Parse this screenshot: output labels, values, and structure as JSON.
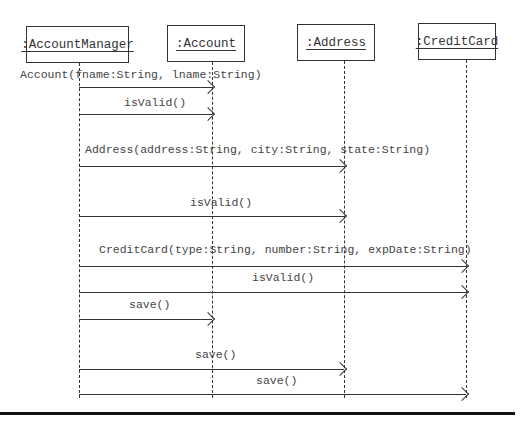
{
  "objects": [
    {
      "name": ":AccountManager",
      "box": [
        26,
        26,
        103,
        37
      ],
      "lifeline_x": 79
    },
    {
      "name": ":Account",
      "box": [
        167,
        25,
        78,
        37
      ],
      "lifeline_x": 212
    },
    {
      "name": ":Address",
      "box": [
        297,
        24,
        78,
        37
      ],
      "lifeline_x": 344
    },
    {
      "name": ":CreditCard",
      "box": [
        418,
        23,
        78,
        37
      ],
      "lifeline_x": 466
    }
  ],
  "messages": [
    {
      "label": "Account(fname:String, lname:String)",
      "from": 0,
      "to": 1,
      "y": 87,
      "label_x": 20,
      "label_y": 68
    },
    {
      "label": "isValid()",
      "from": 0,
      "to": 1,
      "y": 114,
      "label_x": 124,
      "label_y": 96
    },
    {
      "label": "Address(address:String, city:String, state:String)",
      "from": 0,
      "to": 2,
      "y": 166,
      "label_x": 85,
      "label_y": 143
    },
    {
      "label": "isValid()",
      "from": 0,
      "to": 2,
      "y": 216,
      "label_x": 190,
      "label_y": 196
    },
    {
      "label": "CreditCard(type:String, number:String, expDate:String)",
      "from": 0,
      "to": 3,
      "y": 266,
      "label_x": 99,
      "label_y": 243
    },
    {
      "label": "isValid()",
      "from": 0,
      "to": 3,
      "y": 292,
      "label_x": 252,
      "label_y": 271
    },
    {
      "label": "save()",
      "from": 0,
      "to": 1,
      "y": 319,
      "label_x": 129,
      "label_y": 298
    },
    {
      "label": "save()",
      "from": 0,
      "to": 2,
      "y": 369,
      "label_x": 195,
      "label_y": 348
    },
    {
      "label": "save()",
      "from": 0,
      "to": 3,
      "y": 394,
      "label_x": 256,
      "label_y": 374
    }
  ],
  "lifeline_top": 62,
  "lifeline_bottom": 398
}
